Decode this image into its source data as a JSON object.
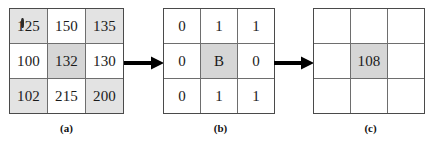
{
  "figure": {
    "colors": {
      "grid_line": "#6e6e6e",
      "border": "#4a4a4a",
      "cell_background": "#ffffff",
      "shade_light": "#e3e3e3",
      "shade_mid": "#d6d6d6",
      "arrow": "#000000",
      "text": "#1a1a1a"
    }
  },
  "panels": [
    {
      "id": "a",
      "caption": "(a)",
      "type": "intensity",
      "rows": [
        [
          {
            "value": "125",
            "shaded": "light"
          },
          {
            "value": "150",
            "shaded": "none"
          },
          {
            "value": "135",
            "shaded": "light"
          }
        ],
        [
          {
            "value": "100",
            "shaded": "none"
          },
          {
            "value": "132",
            "shaded": "mid"
          },
          {
            "value": "130",
            "shaded": "none"
          }
        ],
        [
          {
            "value": "102",
            "shaded": "light"
          },
          {
            "value": "215",
            "shaded": "none"
          },
          {
            "value": "200",
            "shaded": "light"
          }
        ]
      ]
    },
    {
      "id": "b",
      "caption": "(b)",
      "type": "binary",
      "rows": [
        [
          {
            "value": "0",
            "shaded": "none"
          },
          {
            "value": "1",
            "shaded": "none"
          },
          {
            "value": "1",
            "shaded": "none"
          }
        ],
        [
          {
            "value": "0",
            "shaded": "none"
          },
          {
            "value": "B",
            "shaded": "mid"
          },
          {
            "value": "0",
            "shaded": "none"
          }
        ],
        [
          {
            "value": "0",
            "shaded": "none"
          },
          {
            "value": "1",
            "shaded": "none"
          },
          {
            "value": "1",
            "shaded": "none"
          }
        ]
      ]
    },
    {
      "id": "c",
      "caption": "(c)",
      "type": "result",
      "rows": [
        [
          {
            "value": "",
            "shaded": "none"
          },
          {
            "value": "",
            "shaded": "none"
          },
          {
            "value": "",
            "shaded": "none"
          }
        ],
        [
          {
            "value": "",
            "shaded": "none"
          },
          {
            "value": "108",
            "shaded": "mid"
          },
          {
            "value": "",
            "shaded": "none"
          }
        ],
        [
          {
            "value": "",
            "shaded": "none"
          },
          {
            "value": "",
            "shaded": "none"
          },
          {
            "value": "",
            "shaded": "none"
          }
        ]
      ]
    }
  ],
  "arrows": [
    {
      "id": "arrow-a-to-b",
      "direction": "right"
    },
    {
      "id": "arrow-b-to-c",
      "direction": "right"
    }
  ]
}
